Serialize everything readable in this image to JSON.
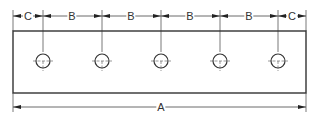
{
  "colors": {
    "line": "#333333",
    "thin": "#555555",
    "background": "#ffffff"
  },
  "plate": {
    "x": 13,
    "y": 31,
    "width": 293,
    "height": 62
  },
  "holes": {
    "count": 5,
    "centers_x": [
      43,
      102,
      161,
      220,
      278
    ],
    "center_y": 61,
    "radius": 7
  },
  "dimensions": {
    "top_line_y": 16,
    "bottom_line_y": 107,
    "labels": {
      "edge_left": "C",
      "spacing_1": "B",
      "spacing_2": "B",
      "spacing_3": "B",
      "spacing_4": "B",
      "edge_right": "C",
      "overall": "A"
    }
  }
}
